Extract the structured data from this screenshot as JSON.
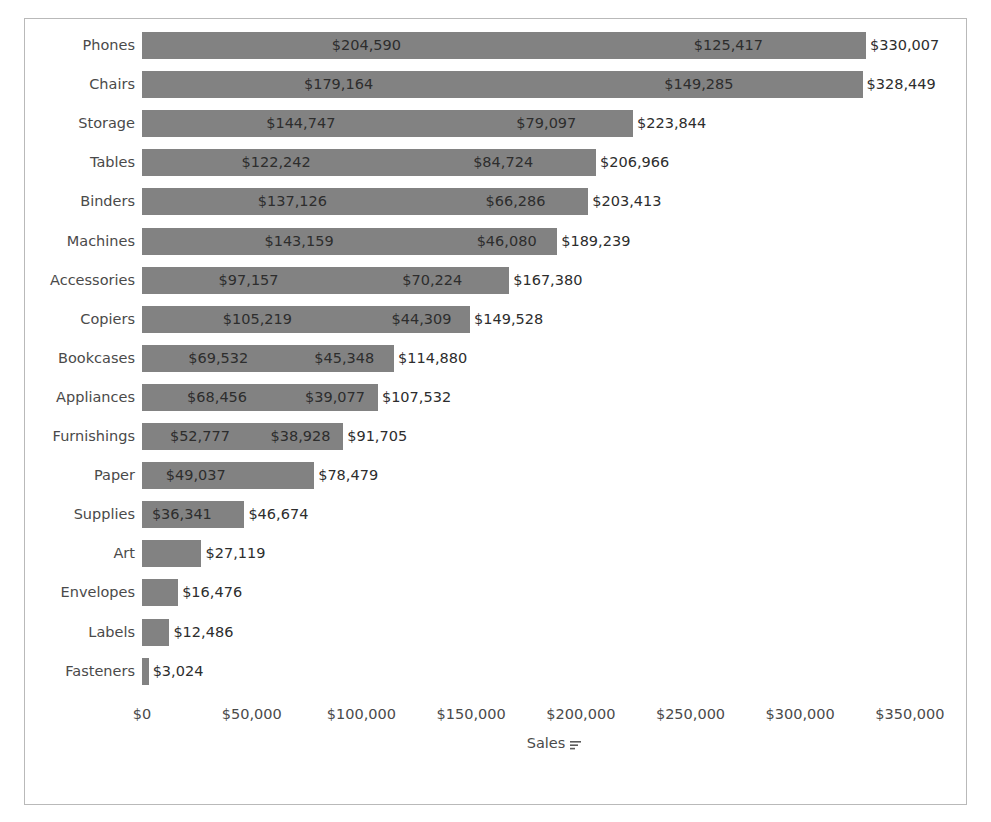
{
  "chart_data": {
    "type": "bar",
    "orientation": "horizontal",
    "stacked": true,
    "title": "",
    "subtitle": "",
    "xlabel": "Sales",
    "ylabel": "",
    "xlim": [
      0,
      350000
    ],
    "xticks": [
      0,
      50000,
      100000,
      150000,
      200000,
      250000,
      300000,
      350000
    ],
    "xtick_labels": [
      "$0",
      "$50,000",
      "$100,000",
      "$150,000",
      "$200,000",
      "$250,000",
      "$300,000",
      "$350,000"
    ],
    "grid": false,
    "legend": null,
    "bar_color": "#828282",
    "categories": [
      "Phones",
      "Chairs",
      "Storage",
      "Tables",
      "Binders",
      "Machines",
      "Accessories",
      "Copiers",
      "Bookcases",
      "Appliances",
      "Furnishings",
      "Paper",
      "Supplies",
      "Art",
      "Envelopes",
      "Labels",
      "Fasteners"
    ],
    "series": [
      {
        "name": "segment-1",
        "values": [
          204590,
          179164,
          144747,
          122242,
          137126,
          143159,
          97157,
          105219,
          69532,
          68456,
          52777,
          49037,
          36341,
          27119,
          16476,
          12486,
          3024
        ],
        "labels": [
          "$204,590",
          "$179,164",
          "$144,747",
          "$122,242",
          "$137,126",
          "$143,159",
          "$97,157",
          "$105,219",
          "$69,532",
          "$68,456",
          "$52,777",
          "$49,037",
          "$36,341",
          "",
          "",
          "",
          ""
        ]
      },
      {
        "name": "segment-2",
        "values": [
          125417,
          149285,
          79097,
          84724,
          66286,
          46080,
          70224,
          44309,
          45348,
          39077,
          38928,
          29442,
          10333,
          0,
          0,
          0,
          0
        ],
        "labels": [
          "$125,417",
          "$149,285",
          "$79,097",
          "$84,724",
          "$66,286",
          "$46,080",
          "$70,224",
          "$44,309",
          "$45,348",
          "$39,077",
          "$38,928",
          "",
          "",
          "",
          "",
          "",
          ""
        ]
      }
    ],
    "totals": [
      330007,
      328449,
      223844,
      206966,
      203413,
      189239,
      167380,
      149528,
      114880,
      107532,
      91705,
      78479,
      46674,
      27119,
      16476,
      12486,
      3024
    ],
    "total_labels": [
      "$330,007",
      "$328,449",
      "$223,844",
      "$206,966",
      "$203,413",
      "$189,239",
      "$167,380",
      "$149,528",
      "$114,880",
      "$107,532",
      "$91,705",
      "$78,479",
      "$46,674",
      "$27,119",
      "$16,476",
      "$12,486",
      "$3,024"
    ]
  },
  "axis": {
    "x_title": "Sales",
    "sort_icon": "sort-descending-icon"
  },
  "colors": {
    "bar": "#828282",
    "border": "#b9b9b9",
    "text": "#4a4a4a",
    "label_text": "#2d2d2d",
    "background": "#ffffff"
  }
}
